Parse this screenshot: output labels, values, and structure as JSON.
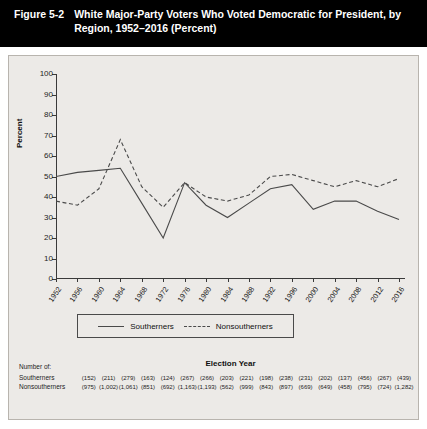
{
  "header": {
    "figure_number": "Figure 5-2",
    "title": "White Major-Party Voters Who Voted Democratic for President, by Region, 1952–2016 (Percent)"
  },
  "legend": {
    "southerners_label": "Southerners",
    "nonsoutherners_label": "Nonsoutherners"
  },
  "ntable": {
    "caption": "Number of:",
    "southerners_label": "Southerners",
    "nonsoutherners_label": "Nonsoutherners",
    "southerners_values": [
      "(152)",
      "(211)",
      "(279)",
      "(163)",
      "(124)",
      "(267)",
      "(266)",
      "(203)",
      "(221)",
      "(198)",
      "(238)",
      "(231)",
      "(202)",
      "(137)",
      "(456)",
      "(267)",
      "(439)"
    ],
    "nonsoutherners_values": [
      "(975)",
      "(1,002)",
      "(1,061)",
      "(851)",
      "(692)",
      "(1,163)",
      "(1,193)",
      "(562)",
      "(999)",
      "(843)",
      "(897)",
      "(669)",
      "(649)",
      "(458)",
      "(795)",
      "(724)",
      "(1,282)"
    ]
  },
  "chart_data": {
    "type": "line",
    "title": "White Major-Party Voters Who Voted Democratic for President, by Region, 1952–2016 (Percent)",
    "xlabel": "Election Year",
    "ylabel": "Percent",
    "ylim": [
      0,
      100
    ],
    "yticks": [
      0,
      10,
      20,
      30,
      40,
      50,
      60,
      70,
      80,
      90,
      100
    ],
    "grid": false,
    "legend_position": "bottom",
    "categories": [
      "1952",
      "1956",
      "1960",
      "1964",
      "1968",
      "1972",
      "1976",
      "1980",
      "1984",
      "1988",
      "1992",
      "1996",
      "2000",
      "2004",
      "2008",
      "2012",
      "2016"
    ],
    "series": [
      {
        "name": "Southerners",
        "style": "solid",
        "color": "#4a4a4a",
        "values": [
          50,
          52,
          53,
          54,
          37,
          20,
          47,
          36,
          30,
          37,
          44,
          46,
          34,
          38,
          38,
          33,
          29
        ]
      },
      {
        "name": "Nonsoutherners",
        "style": "dashed",
        "color": "#4a4a4a",
        "values": [
          38,
          36,
          44,
          68,
          45,
          35,
          47,
          40,
          38,
          41,
          50,
          51,
          48,
          45,
          48,
          45,
          49
        ]
      }
    ]
  }
}
